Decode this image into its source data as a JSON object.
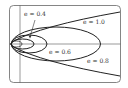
{
  "diagram": {
    "colors": {
      "curve": "#222222",
      "axis": "#555555",
      "frame": "#666666",
      "text": "#333333",
      "background": "#ffffff"
    },
    "curves": [
      {
        "id": "e04",
        "label": "e = 0.4",
        "eccentricity": 0.4,
        "type": "ellipse"
      },
      {
        "id": "e06",
        "label": "e = 0.6",
        "eccentricity": 0.6,
        "type": "ellipse"
      },
      {
        "id": "e08",
        "label": "e = 0.8",
        "eccentricity": 0.8,
        "type": "ellipse"
      },
      {
        "id": "e10",
        "label": "e = 1.0",
        "eccentricity": 1.0,
        "type": "parabola"
      }
    ]
  }
}
